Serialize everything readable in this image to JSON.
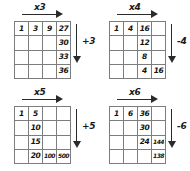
{
  "puzzles": [
    {
      "id": "puzzle-times-3",
      "position": "top-left",
      "row_rule_label": "x3",
      "col_rule_label": "+3",
      "row_arrow_icon": "arrow-right-icon",
      "col_arrow_icon": "arrow-down-icon",
      "cells": [
        [
          "1",
          "3",
          "9",
          "27"
        ],
        [
          "",
          "",
          "",
          "30"
        ],
        [
          "",
          "",
          "",
          "33"
        ],
        [
          "",
          "",
          "",
          "36"
        ]
      ]
    },
    {
      "id": "puzzle-times-4",
      "position": "top-right",
      "row_rule_label": "x4",
      "col_rule_label": "-4",
      "row_arrow_icon": "arrow-right-icon",
      "col_arrow_icon": "arrow-down-icon",
      "cells": [
        [
          "1",
          "4",
          "16",
          ""
        ],
        [
          "",
          "",
          "12",
          ""
        ],
        [
          "",
          "",
          "8",
          ""
        ],
        [
          "",
          "",
          "4",
          "16"
        ]
      ]
    },
    {
      "id": "puzzle-times-5",
      "position": "bottom-left",
      "row_rule_label": "x5",
      "col_rule_label": "+5",
      "row_arrow_icon": "arrow-right-icon",
      "col_arrow_icon": "arrow-down-icon",
      "cells": [
        [
          "1",
          "5",
          "",
          ""
        ],
        [
          "",
          "10",
          "",
          ""
        ],
        [
          "",
          "15",
          "",
          ""
        ],
        [
          "",
          "20",
          "100",
          "500"
        ]
      ]
    },
    {
      "id": "puzzle-times-6",
      "position": "bottom-right",
      "row_rule_label": "x6",
      "col_rule_label": "-6",
      "row_arrow_icon": "arrow-right-icon",
      "col_arrow_icon": "arrow-down-icon",
      "cells": [
        [
          "1",
          "6",
          "36",
          ""
        ],
        [
          "",
          "",
          "30",
          ""
        ],
        [
          "",
          "",
          "24",
          "144"
        ],
        [
          "",
          "",
          "",
          "138"
        ]
      ]
    }
  ],
  "colors": {
    "grid_line": "#7d7d7d",
    "arrow": "#2a2a2a",
    "text": "#111111",
    "background": "#ffffff"
  }
}
